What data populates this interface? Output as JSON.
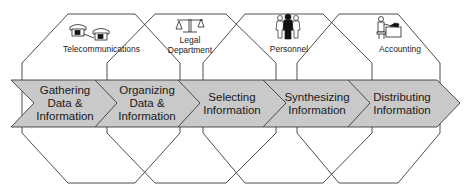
{
  "departments": [
    {
      "name": "Telecommunications",
      "icon": "telephone-icon"
    },
    {
      "name_line1": "Legal",
      "name_line2": "Department",
      "icon": "scales-icon"
    },
    {
      "name": "Personnel",
      "icon": "people-icon"
    },
    {
      "name": "Accounting",
      "icon": "accountant-icon"
    }
  ],
  "steps": [
    {
      "line1": "Gathering",
      "line2": "Data &",
      "line3": "Information"
    },
    {
      "line1": "Organizing",
      "line2": "Data &",
      "line3": "Information"
    },
    {
      "line1": "Selecting",
      "line2": "Information"
    },
    {
      "line1": "Synthesizing",
      "line2": "Information"
    },
    {
      "line1": "Distributing",
      "line2": "Information"
    }
  ],
  "colors": {
    "band_fill": "#c9c9c9",
    "stroke": "#3a3a3a",
    "background": "#ffffff"
  }
}
